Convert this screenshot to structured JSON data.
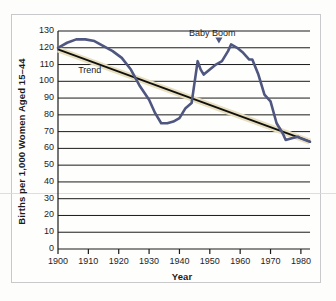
{
  "chart_data": {
    "type": "line",
    "title": "",
    "xlabel": "Year",
    "ylabel": "Births per 1,000 Women Aged 15–44",
    "xlim": [
      1900,
      1983
    ],
    "ylim": [
      0,
      130
    ],
    "grid": true,
    "grid_axis": "y",
    "legend": "none",
    "y_ticks": [
      0,
      10,
      20,
      30,
      40,
      50,
      60,
      70,
      80,
      90,
      100,
      110,
      120,
      130
    ],
    "x_ticks": [
      1900,
      1910,
      1920,
      1930,
      1940,
      1950,
      1960,
      1970,
      1980
    ],
    "series": [
      {
        "name": "Birth rate",
        "color": "#4f5680",
        "x": [
          1900,
          1903,
          1906,
          1909,
          1912,
          1915,
          1918,
          1921,
          1924,
          1927,
          1930,
          1932,
          1934,
          1936,
          1938,
          1940,
          1942,
          1944,
          1946,
          1947,
          1948,
          1950,
          1952,
          1954,
          1956,
          1957,
          1959,
          1961,
          1963,
          1964,
          1966,
          1968,
          1970,
          1972,
          1974,
          1975,
          1977,
          1979,
          1980,
          1983
        ],
        "values": [
          120,
          123,
          125,
          125,
          124,
          121,
          118,
          114,
          107,
          97,
          89,
          81,
          75,
          75,
          76,
          78,
          84,
          87,
          112,
          107,
          104,
          107,
          110,
          112,
          118,
          122,
          120,
          117,
          113,
          113,
          104,
          92,
          88,
          75,
          69,
          65,
          66,
          67,
          66,
          64
        ]
      },
      {
        "name": "Trend",
        "color": "#101010",
        "band_color": "#e8dfbe",
        "x": [
          1900,
          1983
        ],
        "values": [
          119,
          64
        ]
      }
    ],
    "annotations": [
      {
        "text": "Baby Boom",
        "x": 1953,
        "y": 128
      },
      {
        "text": "Trend",
        "x": 1906,
        "y": 106
      }
    ]
  },
  "x_tick_labels": [
    "1900",
    "1910",
    "1920",
    "1930",
    "1940",
    "1950",
    "1960",
    "1970",
    "1980"
  ],
  "y_tick_labels": [
    "130",
    "120",
    "110",
    "100",
    "90",
    "80",
    "70",
    "60",
    "50",
    "40",
    "30",
    "20",
    "10",
    "0"
  ]
}
